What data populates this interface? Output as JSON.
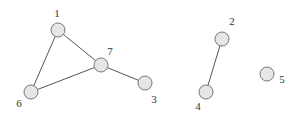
{
  "diagram": {
    "type": "undirected-graph",
    "node_radius": 7,
    "colors": {
      "node_fill": "#e6e6e6",
      "node_stroke": "#777777",
      "edge": "#555555",
      "label": "#333333"
    },
    "nodes": [
      {
        "id": "1",
        "label": "1",
        "x": 58,
        "y": 30,
        "label_x": 57,
        "label_y": 17
      },
      {
        "id": "2",
        "label": "2",
        "x": 222,
        "y": 39,
        "label_x": 232,
        "label_y": 25
      },
      {
        "id": "3",
        "label": "3",
        "x": 145,
        "y": 83,
        "label_x": 154,
        "label_y": 103
      },
      {
        "id": "4",
        "label": "4",
        "x": 206,
        "y": 92,
        "label_x": 198,
        "label_y": 110
      },
      {
        "id": "5",
        "label": "5",
        "x": 267,
        "y": 74,
        "label_x": 282,
        "label_y": 83
      },
      {
        "id": "6",
        "label": "6",
        "x": 31,
        "y": 92,
        "label_x": 19,
        "label_y": 107
      },
      {
        "id": "7",
        "label": "7",
        "x": 101,
        "y": 65,
        "label_x": 110,
        "label_y": 55
      }
    ],
    "edges": [
      {
        "from": "1",
        "to": "7"
      },
      {
        "from": "1",
        "to": "6"
      },
      {
        "from": "6",
        "to": "7"
      },
      {
        "from": "7",
        "to": "3"
      },
      {
        "from": "2",
        "to": "4"
      }
    ]
  }
}
